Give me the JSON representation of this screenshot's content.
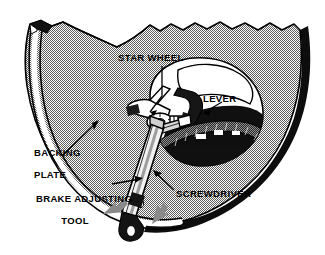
{
  "figure": {
    "background_color": "#ffffff",
    "ink_color": "#000000",
    "plate_fill_color": "#a9a9a9",
    "plate_dark_color": "#111111",
    "highlight_color": "#ffffff",
    "arrow_gray_color": "#8b8b8b"
  },
  "callouts": [
    {
      "id": "star-wheel",
      "label": "STAR WHEEL",
      "lines": [
        "STAR WHEEL"
      ],
      "x": 118,
      "y": 52,
      "align": "left"
    },
    {
      "id": "lever",
      "label": "LEVER",
      "lines": [
        "LEVER"
      ],
      "x": 203,
      "y": 93,
      "align": "left"
    },
    {
      "id": "backing-plate",
      "label": "BACKING PLATE",
      "lines": [
        "BACKING",
        "PLATE"
      ],
      "x": 22,
      "y": 136,
      "align": "left"
    },
    {
      "id": "brake-adjusting-tool",
      "label": "BRAKE ADJUSTING TOOL",
      "lines": [
        "BRAKE ADJUSTING",
        "TOOL"
      ],
      "x": 30,
      "y": 182,
      "align": "center"
    },
    {
      "id": "screwdriver",
      "label": "SCREWDRIVER",
      "lines": [
        "SCREWDRIVER"
      ],
      "x": 176,
      "y": 188,
      "align": "left"
    }
  ],
  "parts": {
    "backing_plate": "backing-plate-body",
    "star_wheel": "star-wheel-adjuster",
    "lever": "adjuster-lever",
    "tool": "brake-adjusting-tool",
    "screwdriver": "screwdriver-blade",
    "motion_arrows": 2
  }
}
